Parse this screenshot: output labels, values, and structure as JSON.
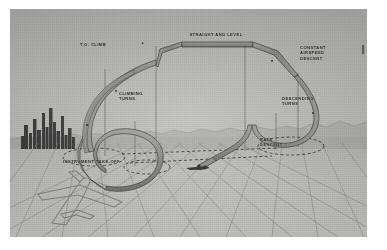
{
  "figure": {
    "kind": "instrument-flight-maneuver-diagram",
    "medium": "halftone printed plate",
    "plate_background": "#b9b9b7",
    "ink": "#2b2b2b"
  },
  "labels": {
    "takeoff_climb": "T.O. CLIMB",
    "straight_and_level": "STRAIGHT AND LEVEL",
    "constant_airspeed_descent": "CONSTANT\nAIRSPEED\nDESCENT",
    "climbing_turns": "CLIMBING\nTURNS",
    "descending_turns": "DESCENDING\nTURNS",
    "rate_descent": "RATE\nDESCENT",
    "instrument_take_off": "INSTRUMENT TAKE-OFF"
  },
  "scene": {
    "skyline_name": "city-skyline",
    "horizon_name": "horizon-mountains",
    "grid_name": "perspective-ground-grid",
    "aircraft_foreground": "parked-airplane-outline",
    "aircraft_landing": "landing-airplane-silhouette",
    "ground_track_name": "dashed-ground-track",
    "ribbon_name": "flight-path-ribbon"
  },
  "colors": {
    "ribbon_face": "#8e8e8c",
    "ribbon_edge": "#3a3a38",
    "grid_line": "#7e7e7c",
    "skyline": "#39393a",
    "dashed": "#2f2f2e",
    "drop_line": "#4a4a48"
  }
}
